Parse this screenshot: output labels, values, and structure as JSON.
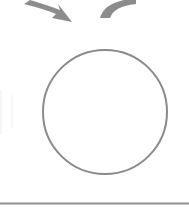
{
  "diagram": {
    "width": 189,
    "height": 207,
    "colors": {
      "background": "#ffffff",
      "stroke": "#8a8a8a",
      "arrow_fill": "#8c8c8c",
      "faint_line": "#e6e6e6",
      "rule": "#8f8f8f"
    },
    "circle": {
      "cx": 105,
      "cy": 112,
      "r": 62,
      "stroke_width": 2
    },
    "arrows": [
      {
        "name": "incoming-arrow",
        "direction": "down-right"
      },
      {
        "name": "outgoing-curved-arrow",
        "direction": "up-right"
      }
    ],
    "bottom_rule": {
      "y": 203
    }
  }
}
